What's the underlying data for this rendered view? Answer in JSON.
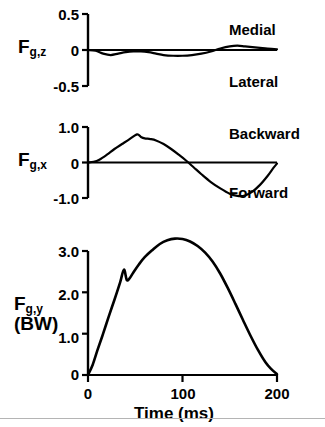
{
  "figure": {
    "xaxis_title": "Time (ms)",
    "x_ticks": [
      "0",
      "100",
      "200"
    ],
    "panels": [
      {
        "series_base": "F",
        "series_sub": "g,z",
        "unit": "",
        "y_ticks": [
          "0.5",
          "0",
          "-0.5"
        ],
        "positive_direction": "Medial",
        "negative_direction": "Lateral"
      },
      {
        "series_base": "F",
        "series_sub": "g,x",
        "unit": "",
        "y_ticks": [
          "1.0",
          "0",
          "-1.0"
        ],
        "positive_direction": "Backward",
        "negative_direction": "Forward"
      },
      {
        "series_base": "F",
        "series_sub": "g,y",
        "unit": "(BW)",
        "y_ticks": [
          "3.0",
          "2.0",
          "1.0",
          "0"
        ],
        "positive_direction": "",
        "negative_direction": ""
      }
    ]
  },
  "chart_data": [
    {
      "type": "line",
      "title": "",
      "xlabel": "Time (ms)",
      "ylabel": "F_g,z",
      "xlim": [
        0,
        200
      ],
      "ylim": [
        -0.5,
        0.5
      ],
      "yticks": [
        -0.5,
        0,
        0.5
      ],
      "xticks": [
        0,
        100,
        200
      ],
      "grid": false,
      "legend": "none",
      "annotations": [
        "Medial",
        "Lateral"
      ],
      "x": [
        0,
        8,
        16,
        24,
        32,
        40,
        48,
        56,
        64,
        72,
        80,
        90,
        100,
        110,
        120,
        130,
        140,
        150,
        158,
        166,
        174,
        182,
        190,
        200
      ],
      "y": [
        0.0,
        -0.01,
        -0.05,
        -0.07,
        -0.05,
        -0.03,
        -0.02,
        -0.02,
        -0.03,
        -0.05,
        -0.07,
        -0.08,
        -0.08,
        -0.07,
        -0.05,
        -0.02,
        0.02,
        0.05,
        0.06,
        0.05,
        0.04,
        0.03,
        0.02,
        0.01
      ]
    },
    {
      "type": "line",
      "title": "",
      "xlabel": "Time (ms)",
      "ylabel": "F_g,x",
      "xlim": [
        0,
        200
      ],
      "ylim": [
        -1.0,
        1.0
      ],
      "yticks": [
        -1.0,
        0,
        1.0
      ],
      "xticks": [
        0,
        100,
        200
      ],
      "grid": false,
      "legend": "none",
      "annotations": [
        "Backward",
        "Forward"
      ],
      "x": [
        0,
        6,
        12,
        20,
        28,
        36,
        44,
        52,
        56,
        60,
        66,
        72,
        80,
        88,
        96,
        104,
        112,
        120,
        130,
        140,
        150,
        158,
        166,
        174,
        182,
        190,
        196,
        200
      ],
      "y": [
        0.0,
        0.02,
        0.08,
        0.22,
        0.38,
        0.52,
        0.66,
        0.79,
        0.72,
        0.68,
        0.66,
        0.62,
        0.52,
        0.38,
        0.22,
        0.05,
        -0.14,
        -0.33,
        -0.55,
        -0.73,
        -0.88,
        -0.94,
        -0.93,
        -0.82,
        -0.63,
        -0.38,
        -0.16,
        -0.03
      ]
    },
    {
      "type": "line",
      "title": "",
      "xlabel": "Time (ms)",
      "ylabel": "F_g,y (BW)",
      "xlim": [
        0,
        200
      ],
      "ylim": [
        0,
        3.5
      ],
      "yticks": [
        0,
        1.0,
        2.0,
        3.0
      ],
      "xticks": [
        0,
        100,
        200
      ],
      "grid": false,
      "legend": "none",
      "annotations": [],
      "x": [
        0,
        5,
        10,
        16,
        22,
        28,
        34,
        38,
        41,
        44,
        48,
        54,
        60,
        68,
        76,
        84,
        92,
        100,
        108,
        116,
        124,
        132,
        140,
        148,
        156,
        164,
        172,
        180,
        188,
        194,
        200
      ],
      "y": [
        0.0,
        0.25,
        0.6,
        1.0,
        1.42,
        1.82,
        2.24,
        2.55,
        2.3,
        2.34,
        2.48,
        2.68,
        2.85,
        3.02,
        3.17,
        3.26,
        3.3,
        3.29,
        3.23,
        3.12,
        2.96,
        2.74,
        2.45,
        2.1,
        1.72,
        1.33,
        0.95,
        0.6,
        0.3,
        0.14,
        0.02
      ]
    }
  ]
}
